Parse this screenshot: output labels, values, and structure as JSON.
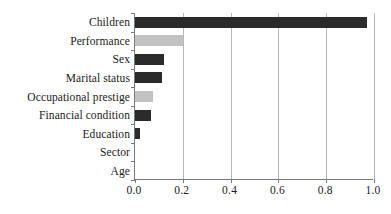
{
  "chart_data": {
    "type": "bar",
    "orientation": "horizontal",
    "title": "",
    "xlabel": "",
    "ylabel": "",
    "categories": [
      "Children",
      "Performance",
      "Sex",
      "Marital status",
      "Occupational prestige",
      "Financial condition",
      "Education",
      "Sector",
      "Age"
    ],
    "values": [
      0.97,
      0.2,
      0.12,
      0.113,
      0.075,
      0.065,
      0.02,
      0.0,
      0.0
    ],
    "bar_colors": [
      "#2b2b2b",
      "#c2c2c2",
      "#2b2b2b",
      "#2b2b2b",
      "#c2c2c2",
      "#2b2b2b",
      "#2b2b2b",
      "#2b2b2b",
      "#2b2b2b"
    ],
    "xlim": [
      0.0,
      1.0
    ],
    "xticks": [
      0.0,
      0.2,
      0.4,
      0.6,
      0.8,
      1.0
    ],
    "xtick_labels": [
      "0.0",
      "0.2",
      "0.4",
      "0.6",
      "0.8",
      "1.0"
    ],
    "grid": "vertical",
    "legend": "none"
  },
  "style": {
    "axis_color": "#7a7a7a",
    "grid_color": "#b9b9b9",
    "text_color": "#1a1a1a",
    "background": "#ffffff",
    "bar_dark": "#2b2b2b",
    "bar_light": "#c2c2c2"
  }
}
